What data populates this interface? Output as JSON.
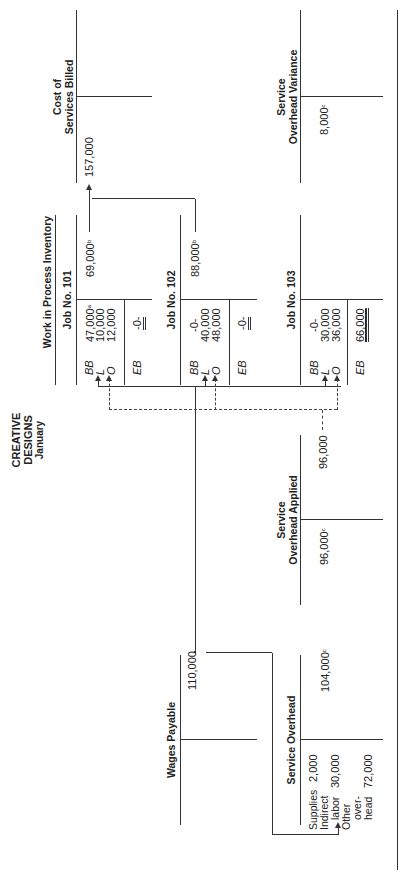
{
  "title": {
    "company": "CREATIVE DESIGNS",
    "period": "January"
  },
  "accounts": {
    "wages_payable": {
      "name": "Wages Payable",
      "credit": "110,000"
    },
    "service_overhead": {
      "name": "Service Overhead",
      "debits": [
        {
          "label": "Supplies",
          "value": "2,000"
        },
        {
          "label1": "Indirect",
          "label2": "labor",
          "value": "30,000"
        },
        {
          "label1": "Other",
          "label2": "over-",
          "label3": "head",
          "value": "72,000"
        }
      ],
      "credit": "104,000",
      "credit_note": "c"
    },
    "service_overhead_applied": {
      "name_line1": "Service",
      "name_line2": "Overhead Applied",
      "debit": "96,000",
      "debit_note": "c",
      "credit": "96,000"
    },
    "wip": {
      "group_title": "Work in Process Inventory",
      "jobs": [
        {
          "name": "Job No. 101",
          "bb": "47,000",
          "bb_note": "a",
          "l": "10,000",
          "o": "12,000",
          "eb": "-0-",
          "credit": "69,000",
          "credit_note": "b"
        },
        {
          "name": "Job No. 102",
          "bb": "-0-",
          "l": "40,000",
          "o": "48,000",
          "eb": "-0-",
          "credit": "88,000",
          "credit_note": "b"
        },
        {
          "name": "Job No. 103",
          "bb": "-0-",
          "l": "30,000",
          "o": "36,000",
          "eb": "66,000"
        }
      ],
      "codes": {
        "bb": "BB",
        "l": "L",
        "o": "O",
        "eb": "EB"
      }
    },
    "cost_of_services_billed": {
      "name_line1": "Cost of",
      "name_line2": "Services Billed",
      "debit": "157,000"
    },
    "service_overhead_variance": {
      "name_line1": "Service",
      "name_line2": "Overhead Variance",
      "debit": "8,000",
      "debit_note": "c"
    }
  }
}
